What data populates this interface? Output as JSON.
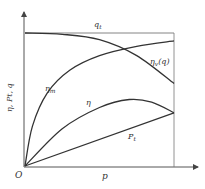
{
  "chart_data": {
    "type": "line",
    "title": "",
    "xlabel": "p",
    "ylabel": "η, Pt, q",
    "origin_label": "O",
    "xlim": [
      0,
      1
    ],
    "ylim": [
      0,
      1.1
    ],
    "grid": false,
    "series": [
      {
        "name": "qt",
        "label": "q",
        "label_sub": "t",
        "x": [
          0,
          1
        ],
        "y": [
          1.0,
          1.0
        ],
        "shape": "horizontal"
      },
      {
        "name": "ηv(q)",
        "label": "η",
        "label_sub": "v",
        "label_suffix": "(q)",
        "x": [
          0,
          0.25,
          0.5,
          0.75,
          1.0
        ],
        "y": [
          1.0,
          0.99,
          0.95,
          0.83,
          0.62
        ],
        "shape": "decreasing"
      },
      {
        "name": "ηm",
        "label": "η",
        "label_sub": "m",
        "x": [
          0,
          0.05,
          0.15,
          0.3,
          0.5,
          0.75,
          1.0
        ],
        "y": [
          0,
          0.3,
          0.55,
          0.72,
          0.83,
          0.9,
          0.94
        ],
        "shape": "rising-saturating"
      },
      {
        "name": "η",
        "label": "η",
        "label_sub": "",
        "x": [
          0,
          0.25,
          0.5,
          0.7,
          0.85,
          1.0
        ],
        "y": [
          0,
          0.28,
          0.44,
          0.5,
          0.48,
          0.4
        ],
        "shape": "hump"
      },
      {
        "name": "Pt",
        "label": "P",
        "label_sub": "t",
        "x": [
          0,
          1
        ],
        "y": [
          0,
          0.4
        ],
        "shape": "linear"
      }
    ]
  }
}
